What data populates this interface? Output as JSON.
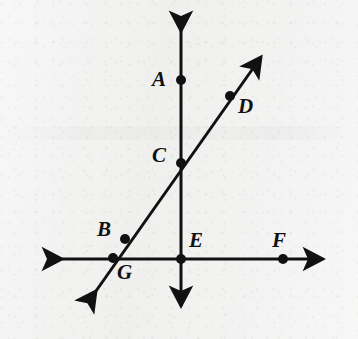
{
  "figure": {
    "kind": "geometry-diagram",
    "width": 358,
    "height": 339,
    "background_color": "#f1f1f0",
    "ink_color": "#111111",
    "line_width": 3,
    "dot_radius": 5
  },
  "lines": [
    {
      "name": "vertical-line",
      "label": "vertical line through A, C, E",
      "x1": 181,
      "y1": 31,
      "x2": 181,
      "y2": 306,
      "arrow_start": true,
      "arrow_end": true
    },
    {
      "name": "horizontal-line",
      "label": "horizontal line through G, E, F",
      "x1": 62,
      "y1": 259,
      "x2": 323,
      "y2": 259,
      "arrow_start": true,
      "arrow_end": true
    },
    {
      "name": "diagonal-line",
      "label": "diagonal line through G, B, C, D",
      "x1": 96,
      "y1": 291,
      "x2": 261,
      "y2": 57,
      "arrow_start": true,
      "arrow_end": true
    }
  ],
  "points": [
    {
      "name": "point-a",
      "letter": "A",
      "x": 181,
      "y": 80,
      "label_x": 152,
      "label_y": 69
    },
    {
      "name": "point-b",
      "letter": "B",
      "x": 125,
      "y": 239,
      "label_x": 97,
      "label_y": 219
    },
    {
      "name": "point-c",
      "letter": "C",
      "x": 181,
      "y": 163,
      "label_x": 152,
      "label_y": 145
    },
    {
      "name": "point-d",
      "letter": "D",
      "x": 230,
      "y": 96,
      "label_x": 238,
      "label_y": 96
    },
    {
      "name": "point-e",
      "letter": "E",
      "x": 181,
      "y": 259,
      "label_x": 189,
      "label_y": 230
    },
    {
      "name": "point-f",
      "letter": "F",
      "x": 283,
      "y": 259,
      "label_x": 272,
      "label_y": 230
    },
    {
      "name": "point-g",
      "letter": "G",
      "x": 113,
      "y": 258,
      "label_x": 117,
      "label_y": 262
    }
  ]
}
